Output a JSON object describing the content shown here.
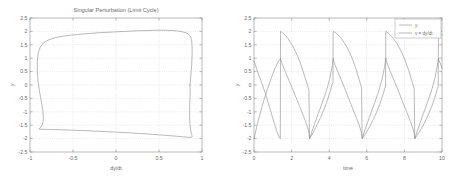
{
  "figure": {
    "background": "#ffffff",
    "axis_color": "#8a8a8a",
    "grid_color": "#c8c8d8",
    "curve_color": "#8d8d8d"
  },
  "chart_data": [
    {
      "type": "line",
      "id": "phase-portrait",
      "title": "Singular Perturbation (Limit Cycle)",
      "xlabel": "dy/dt",
      "ylabel": "y",
      "xlim": [
        -1,
        1
      ],
      "ylim": [
        -2.5,
        2.5
      ],
      "grid": true,
      "legend": null,
      "xticks": [
        "-1",
        "-0.5",
        "0",
        "0.5",
        "1"
      ],
      "xtick_values": [
        -1,
        -0.5,
        0,
        0.5,
        1
      ],
      "yticks": [
        "2.5",
        "2",
        "1.5",
        "1",
        "0.5",
        "0",
        "-0.5",
        "-1",
        "-1.5",
        "-2",
        "-2.5"
      ],
      "ytick_values": [
        2.5,
        2,
        1.5,
        1,
        0.5,
        0,
        -0.5,
        -1,
        -1.5,
        -2,
        -2.5
      ],
      "series": [
        {
          "name": "limit cycle",
          "x": [
            0.86,
            0.87,
            0.88,
            0.885,
            0.885,
            0.88,
            0.87,
            0.85,
            0.82,
            0.78,
            0.73,
            0.67,
            0.6,
            0.52,
            0.43,
            0.33,
            0.22,
            0.1,
            -0.02,
            -0.15,
            -0.28,
            -0.4,
            -0.52,
            -0.62,
            -0.71,
            -0.78,
            -0.84,
            -0.88,
            -0.905,
            -0.915,
            -0.915,
            -0.908,
            -0.895,
            -0.878,
            -0.862,
            -0.85,
            -0.845,
            -0.848,
            -0.858,
            -0.872,
            -0.885,
            -0.893,
            -0.897,
            -0.895,
            -0.888,
            -0.872,
            -0.848,
            -0.815,
            -0.775,
            -0.728,
            -0.675,
            -0.616,
            -0.552,
            -0.484,
            -0.412,
            -0.337,
            -0.258,
            -0.177,
            -0.093,
            -0.007,
            0.08,
            0.168,
            0.256,
            0.342,
            0.426,
            0.506,
            0.582,
            0.652,
            0.714,
            0.768,
            0.812,
            0.845,
            0.868,
            0.881,
            0.886,
            0.884,
            0.877,
            0.868,
            0.86,
            0.856,
            0.857,
            0.862,
            0.86
          ],
          "y": [
            0.0,
            0.35,
            0.75,
            1.12,
            1.42,
            1.62,
            1.78,
            1.88,
            1.94,
            1.98,
            2.01,
            2.03,
            2.04,
            2.045,
            2.04,
            2.03,
            2.02,
            2.0,
            1.98,
            1.96,
            1.93,
            1.9,
            1.86,
            1.82,
            1.76,
            1.69,
            1.58,
            1.42,
            1.18,
            0.88,
            0.52,
            0.18,
            -0.14,
            -0.44,
            -0.72,
            -0.98,
            -1.2,
            -1.38,
            -1.5,
            -1.57,
            -1.61,
            -1.63,
            -1.64,
            -1.645,
            -1.648,
            -1.65,
            -1.652,
            -1.655,
            -1.658,
            -1.662,
            -1.667,
            -1.673,
            -1.68,
            -1.688,
            -1.697,
            -1.707,
            -1.718,
            -1.73,
            -1.743,
            -1.757,
            -1.772,
            -1.788,
            -1.805,
            -1.823,
            -1.842,
            -1.861,
            -1.88,
            -1.898,
            -1.915,
            -1.93,
            -1.942,
            -1.95,
            -1.952,
            -1.945,
            -1.925,
            -1.885,
            -1.81,
            -1.68,
            -1.47,
            -1.16,
            -0.76,
            -0.34,
            0.0
          ]
        }
      ]
    },
    {
      "type": "line",
      "id": "time-series",
      "title": "",
      "xlabel": "time",
      "ylabel": "y",
      "xlim": [
        0,
        10
      ],
      "ylim": [
        -2.5,
        2.5
      ],
      "grid": true,
      "legend_position": "upper right",
      "xticks": [
        "0",
        "2",
        "4",
        "6",
        "8",
        "10"
      ],
      "xtick_values": [
        0,
        2,
        4,
        6,
        8,
        10
      ],
      "yticks": [
        "2.5",
        "2",
        "1.5",
        "1",
        "0.5",
        "0",
        "-0.5",
        "-1",
        "-1.5",
        "-2",
        "-2.5"
      ],
      "ytick_values": [
        2.5,
        2,
        1.5,
        1,
        0.5,
        0,
        -0.5,
        -1,
        -1.5,
        -2,
        -2.5
      ],
      "series": [
        {
          "name": "y",
          "legend_label": "y",
          "period": 2.45,
          "x": [
            0.0,
            0.12,
            0.25,
            0.4,
            0.56,
            0.74,
            0.92,
            1.1,
            1.26,
            1.36,
            1.4,
            1.41,
            1.52,
            1.66,
            1.82,
            2.0,
            2.2,
            2.42,
            2.64,
            2.82,
            2.92,
            2.95,
            3.06,
            3.2,
            3.36,
            3.54,
            3.72,
            3.9,
            4.06,
            4.16,
            4.2,
            4.21,
            4.32,
            4.46,
            4.62,
            4.8,
            5.0,
            5.22,
            5.44,
            5.62,
            5.72,
            5.75,
            5.86,
            6.0,
            6.16,
            6.34,
            6.52,
            6.7,
            6.86,
            6.96,
            7.0,
            7.01,
            7.12,
            7.26,
            7.42,
            7.6,
            7.8,
            8.02,
            8.24,
            8.42,
            8.52,
            8.55,
            8.66,
            8.8,
            8.96,
            9.14,
            9.32,
            9.5,
            9.66,
            9.76,
            9.8,
            9.81,
            9.92,
            10.0
          ],
          "y": [
            0.9,
            0.65,
            0.38,
            0.1,
            -0.22,
            -0.62,
            -1.05,
            -1.48,
            -1.82,
            -1.97,
            -2.0,
            2.0,
            1.95,
            1.86,
            1.72,
            1.52,
            1.26,
            0.9,
            0.45,
            0.05,
            -0.18,
            -2.0,
            -1.88,
            -1.7,
            -1.48,
            -1.22,
            -0.92,
            -0.58,
            -0.22,
            0.02,
            0.1,
            2.0,
            1.96,
            1.88,
            1.76,
            1.58,
            1.34,
            1.0,
            0.56,
            0.14,
            -0.1,
            -2.0,
            -1.9,
            -1.74,
            -1.54,
            -1.3,
            -1.02,
            -0.7,
            -0.36,
            -0.12,
            -0.04,
            2.0,
            1.95,
            1.86,
            1.73,
            1.55,
            1.3,
            0.96,
            0.52,
            0.1,
            -0.14,
            -2.0,
            -1.9,
            -1.75,
            -1.55,
            -1.31,
            -1.03,
            -0.71,
            -0.37,
            -0.13,
            -0.05,
            2.0,
            1.92,
            1.86
          ]
        },
        {
          "name": "v = dy/dt",
          "legend_label": "v = dy/dt",
          "period": 2.45,
          "x": [
            0.0,
            0.1,
            0.22,
            0.36,
            0.52,
            0.7,
            0.9,
            1.1,
            1.28,
            1.38,
            1.41,
            1.42,
            1.54,
            1.7,
            1.88,
            2.08,
            2.3,
            2.52,
            2.72,
            2.88,
            2.94,
            2.96,
            3.08,
            3.24,
            3.42,
            3.62,
            3.82,
            4.02,
            4.14,
            4.2,
            4.22,
            4.23,
            4.34,
            4.5,
            4.68,
            4.88,
            5.1,
            5.32,
            5.52,
            5.68,
            5.74,
            5.76,
            5.88,
            6.04,
            6.22,
            6.42,
            6.62,
            6.82,
            6.94,
            7.0,
            7.02,
            7.03,
            7.14,
            7.3,
            7.48,
            7.68,
            7.9,
            8.12,
            8.32,
            8.48,
            8.54,
            8.56,
            8.68,
            8.84,
            9.02,
            9.22,
            9.42,
            9.62,
            9.74,
            9.8,
            9.82,
            9.83,
            9.94,
            10.0
          ],
          "y": [
            -2.0,
            -1.7,
            -1.35,
            -0.98,
            -0.58,
            -0.18,
            0.22,
            0.6,
            0.86,
            0.96,
            1.0,
            0.94,
            0.72,
            0.44,
            0.14,
            -0.2,
            -0.58,
            -0.96,
            -1.32,
            -1.64,
            -1.86,
            -2.0,
            -1.74,
            -1.42,
            -1.06,
            -0.68,
            -0.28,
            0.2,
            0.62,
            0.92,
            1.0,
            0.92,
            0.7,
            0.42,
            0.12,
            -0.22,
            -0.62,
            -1.0,
            -1.36,
            -1.68,
            -1.88,
            -2.0,
            -1.72,
            -1.4,
            -1.04,
            -0.66,
            -0.26,
            0.24,
            0.66,
            0.94,
            1.0,
            0.92,
            0.7,
            0.42,
            0.12,
            -0.22,
            -0.62,
            -1.0,
            -1.36,
            -1.68,
            -1.88,
            -2.0,
            -1.72,
            -1.4,
            -1.04,
            -0.66,
            -0.26,
            0.24,
            0.68,
            0.95,
            1.0,
            0.94,
            0.76,
            0.62
          ]
        }
      ]
    }
  ]
}
